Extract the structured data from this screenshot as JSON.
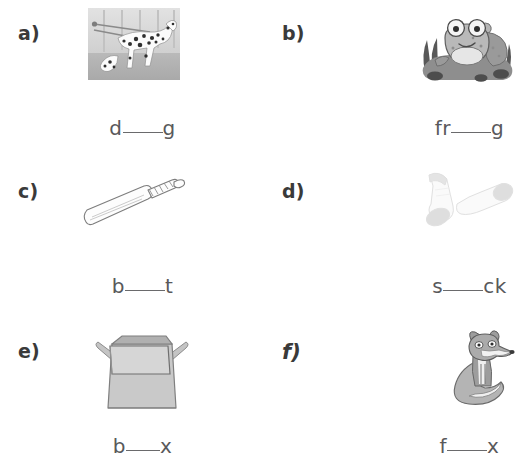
{
  "worksheet": {
    "items": [
      {
        "marker": "a)",
        "marker_style": "plain",
        "picture": "dalmatian-dog-photo",
        "word_prefix": "d",
        "word_suffix": "g",
        "blank_size": "lg",
        "answer_word": "dog"
      },
      {
        "marker": "b)",
        "marker_style": "plain",
        "picture": "frog-on-rock",
        "word_prefix": "fr",
        "word_suffix": "g",
        "blank_size": "lg",
        "answer_word": "frog"
      },
      {
        "marker": "c)",
        "marker_style": "plain",
        "picture": "cricket-bat",
        "word_prefix": "b",
        "word_suffix": "t",
        "blank_size": "lg",
        "answer_word": "bat"
      },
      {
        "marker": "d)",
        "marker_style": "plain",
        "picture": "pair-of-socks",
        "word_prefix": "s",
        "word_suffix": "ck",
        "blank_size": "lg",
        "answer_word": "sock"
      },
      {
        "marker": "e)",
        "marker_style": "plain",
        "picture": "open-cardboard-box",
        "word_prefix": "b",
        "word_suffix": "x",
        "blank_size": "sm",
        "answer_word": "box"
      },
      {
        "marker": "f)",
        "marker_style": "script",
        "picture": "sitting-fox",
        "word_prefix": "f",
        "word_suffix": "x",
        "blank_size": "lg",
        "answer_word": "fox"
      }
    ],
    "colors": {
      "page_background": "#ffffff",
      "marker_text": "#3a3a3a",
      "word_text": "#59595b",
      "blank_rule": "#6a6a6c",
      "art_light_gray": "#d5d5d5",
      "art_mid_gray": "#a8a8a8",
      "art_dark_gray": "#6f6f6f"
    }
  }
}
